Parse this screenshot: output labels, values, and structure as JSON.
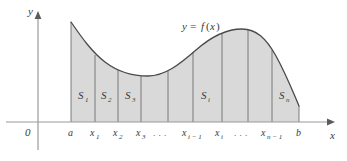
{
  "figure": {
    "type": "area-under-curve-riemann-partition",
    "background": "#ffffff",
    "curve_color": "#4a4a4a",
    "fill_color": "#d9d9d9",
    "axis_color": "#8c8c8c",
    "divider_color": "#6e6e6e",
    "text_color": "#3a3a3a"
  },
  "axes": {
    "y_axis_label": "y",
    "x_axis_label": "x",
    "origin_label": "0"
  },
  "curve": {
    "label": "y = f(x)",
    "label_parts": {
      "y": "y",
      "equals": "=",
      "f": "f",
      "open": "(",
      "x": "x",
      "close": ")"
    }
  },
  "x_ticks": [
    {
      "id": "a",
      "base": "a",
      "sub": "",
      "x": 71
    },
    {
      "id": "x1",
      "base": "x",
      "sub": "1",
      "x": 95
    },
    {
      "id": "x2",
      "base": "x",
      "sub": "2",
      "x": 118
    },
    {
      "id": "x3",
      "base": "x",
      "sub": "3",
      "x": 141
    },
    {
      "id": "dots1",
      "base": ". . .",
      "sub": "",
      "x": 165
    },
    {
      "id": "xi-1",
      "base": "x",
      "sub": "i − 1",
      "x": 193
    },
    {
      "id": "xi",
      "base": "x",
      "sub": "i",
      "x": 222
    },
    {
      "id": "dots2",
      "base": ". . .",
      "sub": "",
      "x": 246
    },
    {
      "id": "xn-1",
      "base": "x",
      "sub": "n − 1",
      "x": 272
    },
    {
      "id": "b",
      "base": "b",
      "sub": "",
      "x": 299
    }
  ],
  "strips": [
    {
      "id": "S1",
      "base": "S",
      "sub": "1",
      "x": 83,
      "y": 99
    },
    {
      "id": "S2",
      "base": "S",
      "sub": "2",
      "x": 106,
      "y": 99
    },
    {
      "id": "S3",
      "base": "S",
      "sub": "3",
      "x": 130,
      "y": 99
    },
    {
      "id": "Si",
      "base": "S",
      "sub": "i",
      "x": 206,
      "y": 99
    },
    {
      "id": "Sn",
      "base": "S",
      "sub": "n",
      "x": 284,
      "y": 99
    }
  ],
  "dividers": [
    {
      "id": "div-a",
      "x": 71
    },
    {
      "id": "div-x1",
      "x": 95
    },
    {
      "id": "div-x2",
      "x": 118
    },
    {
      "id": "div-x3",
      "x": 141
    },
    {
      "id": "div-x4",
      "x": 168
    },
    {
      "id": "div-xi-1",
      "x": 193
    },
    {
      "id": "div-xi",
      "x": 222
    },
    {
      "id": "div-x7",
      "x": 248
    },
    {
      "id": "div-xn-1",
      "x": 272
    },
    {
      "id": "div-b",
      "x": 299
    }
  ]
}
